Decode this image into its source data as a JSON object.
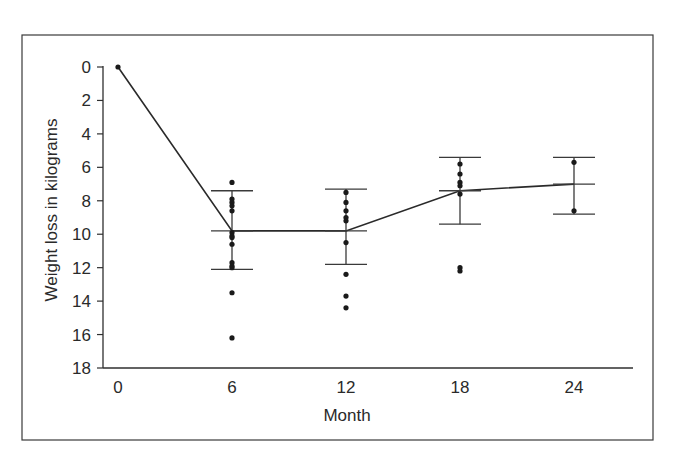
{
  "chart_data": {
    "type": "scatter",
    "title": "",
    "xlabel": "Month",
    "ylabel": "Weight loss in kilograms",
    "x_ticks": [
      0,
      6,
      12,
      18,
      24
    ],
    "y_ticks": [
      0,
      2,
      4,
      6,
      8,
      10,
      12,
      14,
      16,
      18
    ],
    "xlim": [
      -0.5,
      27.5
    ],
    "ylim": [
      0,
      18
    ],
    "y_inverted": true,
    "grid": false,
    "legend": null,
    "mean_line": {
      "x": [
        0,
        6,
        12,
        18,
        24
      ],
      "y": [
        0,
        9.8,
        9.8,
        7.4,
        7.0
      ]
    },
    "error_bars": [
      {
        "x": 6,
        "low": 7.4,
        "high": 12.1
      },
      {
        "x": 12,
        "low": 7.3,
        "high": 11.8
      },
      {
        "x": 18,
        "low": 5.4,
        "high": 9.4
      },
      {
        "x": 24,
        "low": 5.4,
        "high": 8.8
      }
    ],
    "points": [
      {
        "x": 0,
        "values": [
          0
        ]
      },
      {
        "x": 6,
        "values": [
          6.9,
          7.9,
          8.1,
          8.3,
          8.6,
          9.9,
          10.1,
          10.2,
          10.6,
          11.7,
          11.9,
          12.0,
          13.5,
          16.2
        ]
      },
      {
        "x": 12,
        "values": [
          7.5,
          8.1,
          8.6,
          9.0,
          9.2,
          10.5,
          12.4,
          13.7,
          14.4
        ]
      },
      {
        "x": 18,
        "values": [
          5.8,
          6.4,
          6.9,
          7.1,
          7.6,
          12.0,
          12.2
        ]
      },
      {
        "x": 24,
        "values": [
          5.7,
          8.6
        ]
      }
    ]
  },
  "labels": {
    "xlabel": "Month",
    "ylabel": "Weight loss in kilograms"
  }
}
